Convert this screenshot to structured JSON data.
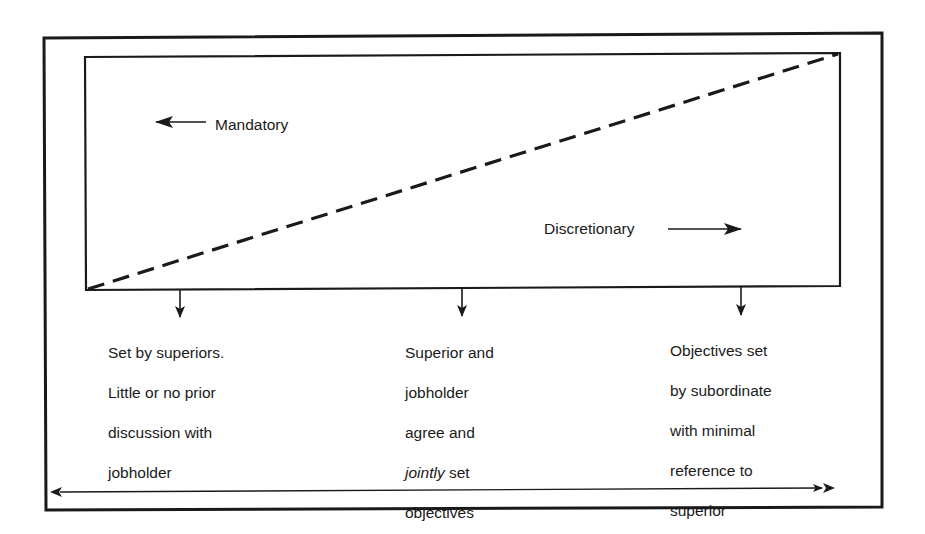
{
  "diagram": {
    "labels": {
      "mandatory": "Mandatory",
      "discretionary": "Discretionary"
    },
    "arrows": {
      "mandatory_arrow": "arrow-left",
      "discretionary_arrow": "arrow-right",
      "continuum_arrow": "double-headed-arrow"
    },
    "positions": [
      {
        "id": "left",
        "text_lines": [
          "Set by superiors.",
          "Little or no prior",
          "discussion with",
          "jobholder"
        ]
      },
      {
        "id": "middle",
        "line1": "Superior and",
        "line2": "jobholder",
        "line3": "agree and",
        "line4_italic": "jointly",
        "line4_rest": " set",
        "line5": "objectives"
      },
      {
        "id": "right",
        "text_lines": [
          "Objectives set",
          "by subordinate",
          "with minimal",
          "reference to",
          "superior"
        ]
      }
    ],
    "colors": {
      "ink": "#1a1a1a",
      "background": "#ffffff"
    }
  }
}
